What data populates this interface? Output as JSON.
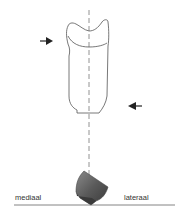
{
  "diagram": {
    "labels": {
      "left": "mediaal",
      "right": "lateraal"
    },
    "colors": {
      "line": "#555555",
      "dash": "#777777",
      "arrow": "#222222",
      "block_dark": "#3a3a3a",
      "block_mid": "#6a6a6a",
      "block_light": "#8a8a8a",
      "ground": "#666666"
    },
    "elements": {
      "tooth_outline": "tooth-crown-outline",
      "axis": "vertical-dashed-axis",
      "arrow_left": "force-arrow-right-pointing",
      "arrow_right": "force-arrow-left-pointing",
      "block": "shaded-block",
      "ground": "baseline"
    }
  }
}
